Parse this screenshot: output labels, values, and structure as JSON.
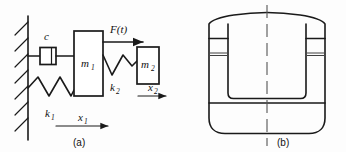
{
  "figure": {
    "title_hidden": "Two-degree-of-freedom spring-mass-damper system and machine cross-section",
    "background_color": "#fdfdfd",
    "line_color": "#1a1a1a",
    "centerline_color": "#555555"
  },
  "panel_a": {
    "caption": "(a)",
    "labels": {
      "damper": "c",
      "mass1": "m",
      "mass1_sub": "1",
      "mass2": "m",
      "mass2_sub": "2",
      "spring1": "k",
      "spring1_sub": "1",
      "spring2": "k",
      "spring2_sub": "2",
      "force": "F(t)",
      "disp1": "x",
      "disp1_sub": "1",
      "disp2": "x",
      "disp2_sub": "2"
    },
    "elements": {
      "wall": "fixed-support-wall-hatched",
      "damper": "viscous-damper-c",
      "spring1": "coil-spring-k1",
      "spring2": "coil-spring-k2",
      "mass1": "rigid-mass-block-m1",
      "mass2": "rigid-mass-block-m2",
      "force_arrow": "applied-force-arrow",
      "disp1_arrow": "displacement-arrow-x1",
      "disp2_arrow": "displacement-arrow-x2"
    }
  },
  "panel_b": {
    "caption": "(b)",
    "elements": {
      "outline": "machine-body-cross-section-outline",
      "cavity": "inner-u-shaped-cavity",
      "base": "base-plate",
      "centerline": "vertical-symmetry-centerline",
      "left_notch": "left-mount-notch",
      "right_notch": "right-mount-notch"
    }
  }
}
